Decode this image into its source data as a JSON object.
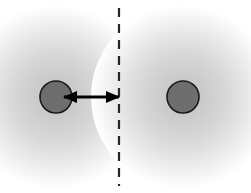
{
  "figure": {
    "width": 251,
    "height": 193,
    "background_color": "#ffffff"
  },
  "diagram_data": {
    "type": "diagram",
    "canvas": {
      "width": 251,
      "height": 193
    },
    "colors": {
      "background": "#ffffff",
      "circle_fill": "#6e6e6e",
      "circle_stroke": "#1a1a1a",
      "halo_inner": "#c9c9c9",
      "halo_outer": "#ffffff",
      "dashed_line": "#262626",
      "arrow": "#000000"
    },
    "halos": [
      {
        "name": "left-halo",
        "cx": 56,
        "cy": 97,
        "r": 92,
        "inner_color": "#c9c9c9",
        "outer_color": "#ffffff"
      },
      {
        "name": "right-halo",
        "cx": 183,
        "cy": 97,
        "r": 92,
        "inner_color": "#c9c9c9",
        "outer_color": "#ffffff"
      }
    ],
    "circles": [
      {
        "name": "left-particle",
        "cx": 56,
        "cy": 97,
        "r": 16,
        "fill": "#6e6e6e",
        "stroke": "#1a1a1a",
        "stroke_width": 1.6
      },
      {
        "name": "right-particle",
        "cx": 183,
        "cy": 97,
        "r": 16,
        "fill": "#6e6e6e",
        "stroke": "#1a1a1a",
        "stroke_width": 1.6
      }
    ],
    "dashed_line": {
      "name": "boundary-line",
      "x": 119,
      "y1": 8,
      "y2": 186,
      "color": "#262626",
      "width": 2.2,
      "dash_length": 9,
      "gap_length": 7
    },
    "arrow": {
      "name": "distance-arrow",
      "x1": 64,
      "x2": 119,
      "y": 97,
      "color": "#000000",
      "shaft_width": 3,
      "double_headed": true,
      "head_length": 13,
      "head_half_height": 6,
      "label": ""
    },
    "labels": []
  }
}
